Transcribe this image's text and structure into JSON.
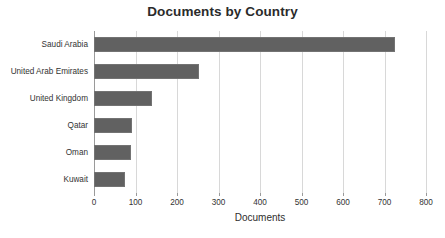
{
  "chart_data": {
    "type": "bar",
    "orientation": "horizontal",
    "title": "Documents by Country",
    "xlabel": "Documents",
    "ylabel": "",
    "categories": [
      "Saudi Arabia",
      "United Arab Emirates",
      "United Kingdom",
      "Qatar",
      "Oman",
      "Kuwait"
    ],
    "values": [
      725,
      252,
      139,
      92,
      89,
      75
    ],
    "xlim": [
      0,
      800
    ],
    "ylim": null,
    "xticks": [
      0,
      100,
      200,
      300,
      400,
      500,
      600,
      700,
      800
    ],
    "xticklabels": [
      "0",
      "100",
      "200",
      "300",
      "400",
      "500",
      "600",
      "700",
      "800"
    ],
    "grid": "vertical",
    "legend": null,
    "bar_color": "#616161",
    "bar_edge_color": "#737373",
    "grid_color": "#d8d8d8",
    "axis_color": "#9a9a9a",
    "background": "#ffffff",
    "title_color": "#2b2b2b",
    "tick_label_color": "#333333"
  }
}
